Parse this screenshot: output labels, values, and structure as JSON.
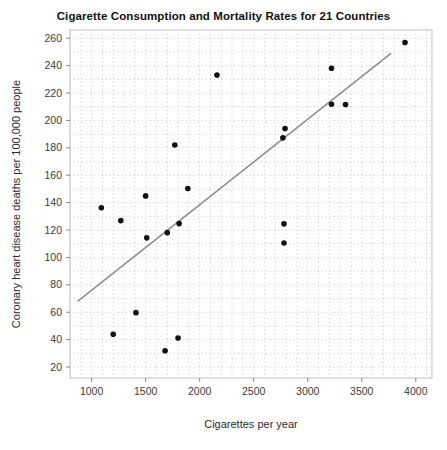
{
  "chart_data": {
    "type": "scatter",
    "title": "Cigarette Consumption and Mortality Rates for 21 Countries",
    "xlabel": "Cigarettes per year",
    "ylabel": "Coronary heart disease deaths per 100,000 people",
    "x_ticks": [
      1000,
      1500,
      2000,
      2500,
      3000,
      3500,
      4000
    ],
    "y_ticks": [
      20,
      40,
      60,
      80,
      100,
      120,
      140,
      160,
      180,
      200,
      220,
      240,
      260
    ],
    "xlim": [
      800,
      4150
    ],
    "ylim": [
      12,
      266
    ],
    "n_points": 21,
    "points": [
      {
        "x": 3900,
        "y": 256.9
      },
      {
        "x": 3350,
        "y": 211.6
      },
      {
        "x": 3220,
        "y": 238.1
      },
      {
        "x": 3220,
        "y": 211.8
      },
      {
        "x": 2790,
        "y": 194.1
      },
      {
        "x": 2770,
        "y": 187.3
      },
      {
        "x": 2780,
        "y": 124.5
      },
      {
        "x": 2780,
        "y": 110.5
      },
      {
        "x": 2160,
        "y": 233.1
      },
      {
        "x": 1890,
        "y": 150.3
      },
      {
        "x": 1810,
        "y": 124.7
      },
      {
        "x": 1800,
        "y": 41.2
      },
      {
        "x": 1770,
        "y": 182.1
      },
      {
        "x": 1700,
        "y": 118.1
      },
      {
        "x": 1680,
        "y": 31.9
      },
      {
        "x": 1510,
        "y": 114.3
      },
      {
        "x": 1500,
        "y": 144.9
      },
      {
        "x": 1410,
        "y": 59.7
      },
      {
        "x": 1270,
        "y": 126.9
      },
      {
        "x": 1200,
        "y": 43.9
      },
      {
        "x": 1090,
        "y": 136.3
      }
    ],
    "trend_line": {
      "x1": 870,
      "y1": 68,
      "x2": 3770,
      "y2": 249
    },
    "legend": "none",
    "grid": {
      "visible": true,
      "x_step": 100,
      "y_step": 10,
      "style": "dotted"
    },
    "colors": {
      "point": "#111111",
      "trend_line": "#8f8f8f",
      "grid": "#c9c9c9",
      "frame": "#bfbfbf",
      "tick_text": "#3a3a3a",
      "title_text": "#111111",
      "background": "#ffffff"
    }
  }
}
